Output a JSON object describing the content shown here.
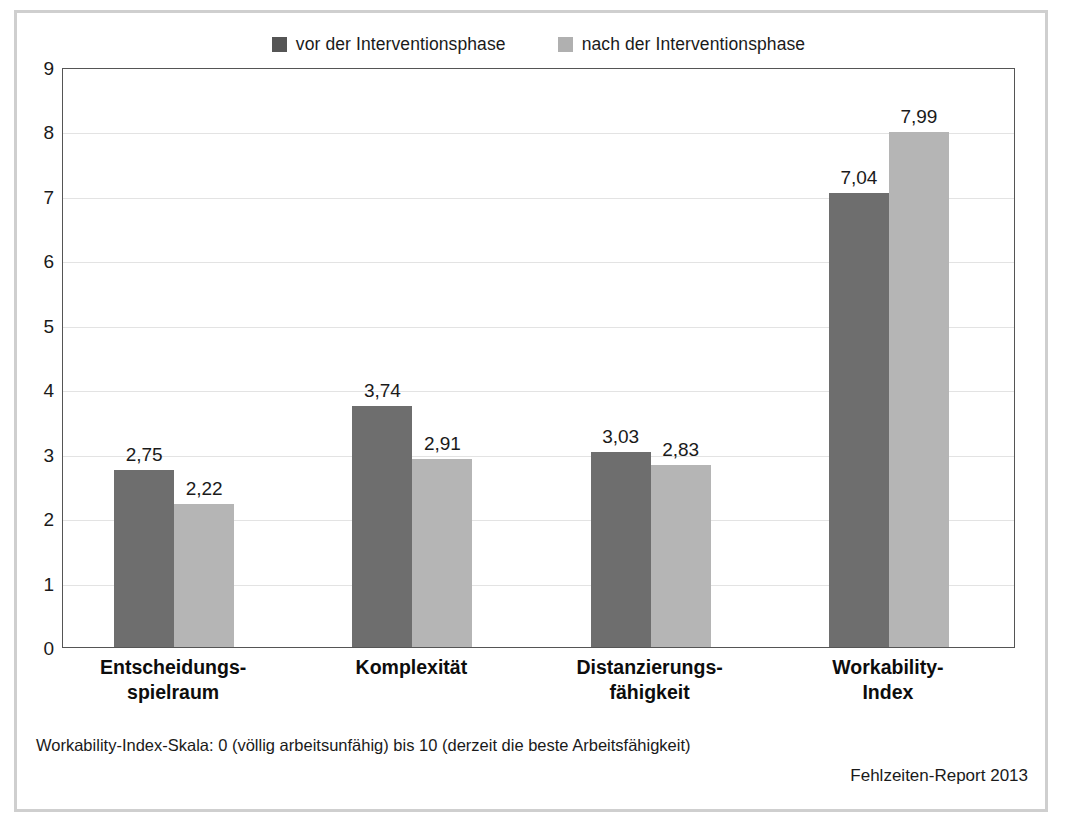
{
  "chart_data": {
    "type": "bar",
    "title": "",
    "subtitle": "",
    "xlabel": "",
    "ylabel": "",
    "ylim": [
      0,
      9
    ],
    "yticks": [
      "9",
      "8",
      "7",
      "6",
      "5",
      "4",
      "3",
      "2",
      "1",
      "0"
    ],
    "grid": true,
    "legend_position": "top-center",
    "categories": [
      "Entscheidungs-\nspielraum",
      "Komplexität",
      "Distanzierungs-\nfähigkeit",
      "Workability-\nIndex"
    ],
    "category_lines": [
      [
        "Entscheidungs-",
        "spielraum"
      ],
      [
        "Komplexität",
        ""
      ],
      [
        "Distanzierungs-",
        "fähigkeit"
      ],
      [
        "Workability-",
        "Index"
      ]
    ],
    "series": [
      {
        "name": "vor der Interventionsphase",
        "color": "#6e6e6e",
        "values": [
          2.75,
          3.74,
          3.03,
          7.04
        ],
        "labels": [
          "2,75",
          "3,74",
          "3,03",
          "7,04"
        ]
      },
      {
        "name": "nach der Interventionsphase",
        "color": "#b5b5b5",
        "values": [
          2.22,
          2.91,
          2.83,
          7.99
        ],
        "labels": [
          "2,22",
          "2,91",
          "2,83",
          "7,99"
        ]
      }
    ]
  },
  "legend": {
    "items": [
      {
        "label": "vor der Interventionsphase",
        "color": "#555555"
      },
      {
        "label": "nach der Interventionsphase",
        "color": "#b0b0b0"
      }
    ]
  },
  "footnote": "Workability-Index-Skala: 0 (völlig arbeitsunfähig) bis 10 (derzeit die beste Arbeitsfähigkeit)",
  "source": "Fehlzeiten-Report 2013",
  "colors": {
    "series_dark": "#6e6e6e",
    "series_light": "#b5b5b5",
    "frame": "#cfcfcf",
    "plot_border": "#555555",
    "gridline": "#e3e3e3",
    "text": "#1a1a1a"
  }
}
